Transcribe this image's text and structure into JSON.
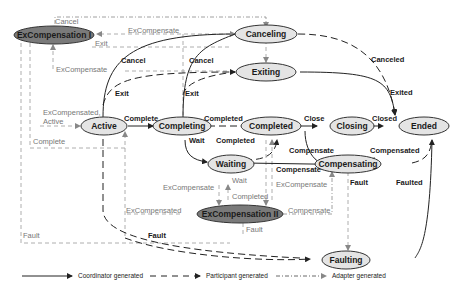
{
  "diagram": {
    "type": "state-machine",
    "states": [
      {
        "id": "excomp1",
        "label": "ExCompensation I",
        "dark": true
      },
      {
        "id": "canceling",
        "label": "Canceling"
      },
      {
        "id": "exiting",
        "label": "Exiting"
      },
      {
        "id": "active",
        "label": "Active"
      },
      {
        "id": "completing",
        "label": "Completing"
      },
      {
        "id": "completed",
        "label": "Completed"
      },
      {
        "id": "closing",
        "label": "Closing"
      },
      {
        "id": "ended",
        "label": "Ended"
      },
      {
        "id": "waiting",
        "label": "Waiting"
      },
      {
        "id": "compensating",
        "label": "Compensating"
      },
      {
        "id": "excomp2",
        "label": "ExCompensation II",
        "dark": true
      },
      {
        "id": "faulting",
        "label": "Faulting"
      }
    ],
    "labels": {
      "cancel_top": "Cancel",
      "excompensate_top": "ExCompensate",
      "exit_top": "Exit",
      "cancel_active": "Cancel",
      "cancel_completing": "Cancel",
      "excompensate_left": "ExCompensate",
      "exit_active": "Exit",
      "exit_completing": "Exit",
      "excompensated_active_1": "ExCompensated,",
      "excompensated_active_2": "Active",
      "complete_1": "Complete",
      "complete_left": "Complete",
      "completed_1": "Completed",
      "wait": "Wait",
      "completed_2": "Completed",
      "close": "Close",
      "closed": "Closed",
      "canceled": "Canceled",
      "exited": "Exited",
      "compensate_1": "Compensate",
      "compensated": "Compensated",
      "compensate_2": "Compensate",
      "excompensate_mid": "ExCompensate",
      "wait_2": "Wait",
      "completed_3": "Completed",
      "excompensate_right": "ExCompensate",
      "excompensated_mid": "ExCompensated",
      "compensate_3": "Compensate",
      "fault_excomp2": "Fault",
      "fault_compensating": "Fault",
      "faulted": "Faulted",
      "fault_left": "Fault",
      "fault_curve": "Fault"
    },
    "legend": [
      {
        "style": "solid",
        "label": "Coordinator generated"
      },
      {
        "style": "dashed",
        "label": "Participant generated"
      },
      {
        "style": "dash-dot",
        "label": "Adapter generated"
      }
    ],
    "colors": {
      "state_fill": "#e4e4e4",
      "dark_state_fill": "#7a7a7a",
      "line": "#222222",
      "adapter_line": "#888888"
    }
  }
}
